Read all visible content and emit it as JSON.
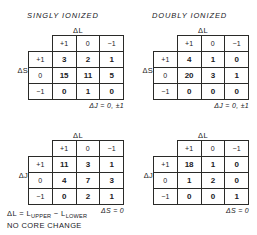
{
  "titles": {
    "singly": "SINGLY IONIZED",
    "doubly": "DOUBLY IONIZED"
  },
  "axis_labels": {
    "delta_l": "ΔL",
    "delta_s": "ΔS",
    "delta_j": "ΔJ"
  },
  "column_headers": [
    "+1",
    "0",
    "−1"
  ],
  "row_headers": [
    "+1",
    "0",
    "−1"
  ],
  "notes": {
    "delta_j_rule": "ΔJ = 0, ±1",
    "delta_s_rule": "ΔS = 0"
  },
  "caption": {
    "line1_pre": "ΔL = L",
    "line1_sub1": "UPPER",
    "line1_mid": " − L",
    "line1_sub2": "LOWER",
    "line2": "NO CORE CHANGE"
  },
  "chart_data": {
    "type": "table",
    "tables": [
      {
        "id": "singly-delta-s",
        "title": "SINGLY IONIZED",
        "row_axis": "ΔS",
        "col_axis": "ΔL",
        "categories": [
          "+1",
          "0",
          "−1"
        ],
        "row_labels": [
          "+1",
          "0",
          "−1"
        ],
        "rows": [
          {
            "label": "+1",
            "values": [
              3,
              2,
              1
            ]
          },
          {
            "label": "0",
            "values": [
              15,
              11,
              5
            ]
          },
          {
            "label": "−1",
            "values": [
              0,
              1,
              0
            ]
          }
        ],
        "note": "ΔJ = 0, ±1"
      },
      {
        "id": "doubly-delta-s",
        "title": "DOUBLY IONIZED",
        "row_axis": "ΔS",
        "col_axis": "ΔL",
        "categories": [
          "+1",
          "0",
          "−1"
        ],
        "row_labels": [
          "+1",
          "0",
          "−1"
        ],
        "rows": [
          {
            "label": "+1",
            "values": [
              4,
              1,
              0
            ]
          },
          {
            "label": "0",
            "values": [
              20,
              3,
              1
            ]
          },
          {
            "label": "−1",
            "values": [
              0,
              0,
              0
            ]
          }
        ],
        "note": "ΔJ = 0, ±1"
      },
      {
        "id": "singly-delta-j",
        "title": "SINGLY IONIZED",
        "row_axis": "ΔJ",
        "col_axis": "ΔL",
        "categories": [
          "+1",
          "0",
          "−1"
        ],
        "row_labels": [
          "+1",
          "0",
          "−1"
        ],
        "rows": [
          {
            "label": "+1",
            "values": [
              11,
              3,
              1
            ]
          },
          {
            "label": "0",
            "values": [
              4,
              7,
              3
            ]
          },
          {
            "label": "−1",
            "values": [
              0,
              2,
              1
            ]
          }
        ],
        "note": "ΔS = 0"
      },
      {
        "id": "doubly-delta-j",
        "title": "DOUBLY IONIZED",
        "row_axis": "ΔJ",
        "col_axis": "ΔL",
        "categories": [
          "+1",
          "0",
          "−1"
        ],
        "row_labels": [
          "+1",
          "0",
          "−1"
        ],
        "rows": [
          {
            "label": "+1",
            "values": [
              18,
              1,
              0
            ]
          },
          {
            "label": "0",
            "values": [
              1,
              2,
              0
            ]
          },
          {
            "label": "−1",
            "values": [
              0,
              0,
              1
            ]
          }
        ],
        "note": "ΔS = 0"
      }
    ]
  }
}
